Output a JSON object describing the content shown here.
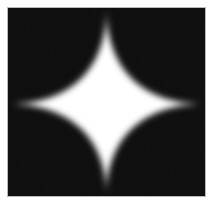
{
  "figure": {
    "shape_name": "astroid",
    "cusp_count": 4,
    "background_color": "#ffffff",
    "field_color": "#0b0b0b",
    "star_color": "#ffffff",
    "border_color": "#b9b9b9",
    "edge_blur_px": 10,
    "canvas": {
      "width": 214,
      "height": 207
    },
    "plate": {
      "x": 8,
      "y": 8,
      "width": 197,
      "height": 188
    },
    "cusps": [
      {
        "name": "top-cusp",
        "x": 110,
        "y": 8
      },
      {
        "name": "right-cusp",
        "x": 205,
        "y": 104
      },
      {
        "name": "bottom-cusp",
        "x": 110,
        "y": 196
      },
      {
        "name": "left-cusp",
        "x": 8,
        "y": 104
      }
    ],
    "center": {
      "x": 110,
      "y": 104
    }
  }
}
